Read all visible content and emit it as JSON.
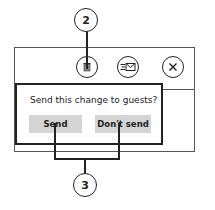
{
  "toolbar": {
    "icons": [
      {
        "name": "delete-icon",
        "glyph": "🗑"
      },
      {
        "name": "reply-email-icon",
        "glyph": "≡✉"
      },
      {
        "name": "close-icon",
        "glyph": "✕"
      }
    ]
  },
  "dialog": {
    "prompt": "Send this change to guests?",
    "send_label": "Send",
    "dont_send_label": "Don't send"
  },
  "callouts": {
    "top": "2",
    "bottom": "3"
  },
  "colors": {
    "line": "#222222",
    "button_bg": "#d4d4d4",
    "border": "#555555"
  }
}
